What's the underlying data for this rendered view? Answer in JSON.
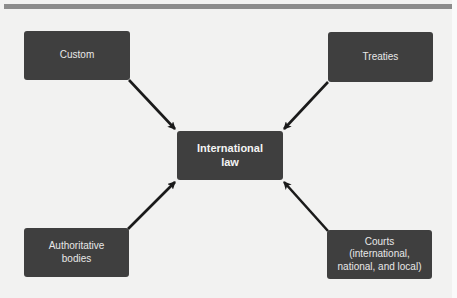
{
  "diagram": {
    "colors": {
      "background": "#f2f2f1",
      "top_bar": "#8c8c8c",
      "box_fill": "#3f3f3f",
      "box_text": "#e8e8e8",
      "arrow": "#1a1a1a"
    },
    "center_node": {
      "label": "International\nlaw"
    },
    "source_nodes": [
      {
        "id": "custom",
        "label": "Custom",
        "position": "top-left"
      },
      {
        "id": "treaties",
        "label": "Treaties",
        "position": "top-right"
      },
      {
        "id": "authoritative-bodies",
        "label": "Authoritative\nbodies",
        "position": "bottom-left"
      },
      {
        "id": "courts",
        "label": "Courts\n(international,\nnational, and local)",
        "position": "bottom-right"
      }
    ],
    "edges": [
      {
        "from": "custom",
        "to": "international-law"
      },
      {
        "from": "treaties",
        "to": "international-law"
      },
      {
        "from": "authoritative-bodies",
        "to": "international-law"
      },
      {
        "from": "courts",
        "to": "international-law"
      }
    ]
  }
}
